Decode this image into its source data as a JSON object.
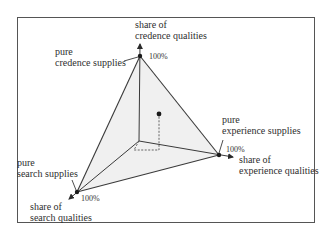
{
  "diagram": {
    "title": "",
    "axes": {
      "credence": {
        "label_line1": "share of",
        "label_line2": "credence qualities",
        "max_label": "100%"
      },
      "experience": {
        "label_line1": "share of",
        "label_line2": "experience qualities",
        "max_label": "100%"
      },
      "search": {
        "label_line1": "share of",
        "label_line2": "search qualities",
        "max_label": "100%"
      }
    },
    "vertices": {
      "credence": {
        "label_line1": "pure",
        "label_line2": "credence supplies"
      },
      "experience": {
        "label_line1": "pure",
        "label_line2": "experience supplies"
      },
      "search": {
        "label_line1": "pure",
        "label_line2": "search supplies"
      }
    },
    "point": {
      "description": "example supply mix inside simplex"
    },
    "colors": {
      "line": "#3a3a3a",
      "fill": "#f2f2f2",
      "frame": "#555555"
    }
  }
}
